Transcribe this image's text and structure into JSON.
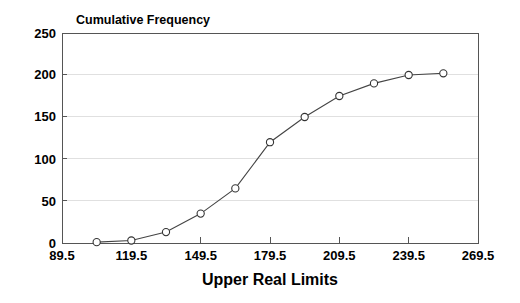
{
  "chart_data": {
    "type": "line",
    "title": "Cumulative Frequency",
    "xlabel": "Upper Real Limits",
    "ylabel": "",
    "xlim": [
      89.5,
      269.5
    ],
    "ylim": [
      0,
      250
    ],
    "grid": true,
    "legend": "none",
    "marker": "open-circle",
    "xticks": [
      "89.5",
      "119.5",
      "149.5",
      "179.5",
      "209.5",
      "239.5",
      "269.5"
    ],
    "xtick_values": [
      89.5,
      119.5,
      149.5,
      179.5,
      209.5,
      239.5,
      269.5
    ],
    "yticks": [
      "0",
      "50",
      "100",
      "150",
      "200",
      "250"
    ],
    "ytick_values": [
      0,
      50,
      100,
      150,
      200,
      250
    ],
    "x": [
      104.5,
      119.5,
      134.5,
      149.5,
      164.5,
      179.5,
      194.5,
      209.5,
      224.5,
      239.5,
      254.5
    ],
    "values": [
      1,
      3,
      13,
      35,
      65,
      120,
      150,
      175,
      190,
      200,
      202
    ],
    "series": [
      {
        "name": "Cumulative Frequency",
        "x": [
          104.5,
          119.5,
          134.5,
          149.5,
          164.5,
          179.5,
          194.5,
          209.5,
          224.5,
          239.5,
          254.5
        ],
        "values": [
          1,
          3,
          13,
          35,
          65,
          120,
          150,
          175,
          190,
          200,
          202
        ]
      }
    ],
    "colors": {
      "line": "#444444",
      "marker_fill": "#ffffff",
      "marker_stroke": "#333333",
      "grid": "#d8d8d8",
      "axis": "#555555",
      "text": "#000000"
    }
  }
}
